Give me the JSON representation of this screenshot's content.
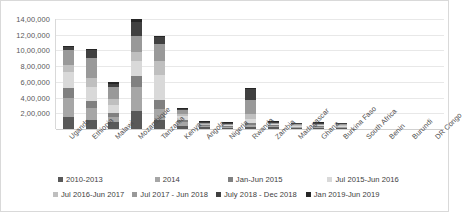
{
  "chart_data": {
    "type": "bar",
    "subtype": "stacked-bar",
    "title": "",
    "xlabel": "",
    "ylabel": "",
    "ylim": [
      0,
      1400000
    ],
    "grid": true,
    "legend_position": "bottom",
    "y_ticks": [
      {
        "value": 1400000,
        "label": "14,00,000"
      },
      {
        "value": 1200000,
        "label": "12,00,000"
      },
      {
        "value": 1000000,
        "label": "10,00,000"
      },
      {
        "value": 800000,
        "label": "8,00,000"
      },
      {
        "value": 600000,
        "label": "6,00,000"
      },
      {
        "value": 400000,
        "label": "4,00,000"
      },
      {
        "value": 200000,
        "label": "2,00,000"
      }
    ],
    "categories": [
      "Uganda",
      "Ethiopia",
      "Malawi",
      "Mozambique",
      "Tanzania",
      "Kenya",
      "Angola",
      "Nigeria",
      "Rwanda",
      "Zambia",
      "Madagascar",
      "Ghana",
      "Burkina Faso",
      "South Africa",
      "Benin",
      "Burundi",
      "DR Congo"
    ],
    "series": [
      {
        "name": "2010-2013",
        "color": "#595959",
        "values": [
          150000,
          120000,
          95000,
          230000,
          110000,
          40000,
          20000,
          15000,
          30000,
          20000,
          10000,
          15000,
          10000,
          0,
          0,
          0,
          0
        ]
      },
      {
        "name": "2014",
        "color": "#a6a6a6",
        "values": [
          250000,
          150000,
          55000,
          300000,
          145000,
          45000,
          15000,
          10000,
          25000,
          15000,
          5000,
          10000,
          5000,
          0,
          0,
          0,
          0
        ]
      },
      {
        "name": "Jan-Jun 2015",
        "color": "#808080",
        "values": [
          120000,
          90000,
          50000,
          150000,
          120000,
          30000,
          8000,
          5000,
          20000,
          10000,
          3000,
          8000,
          3000,
          0,
          0,
          0,
          0
        ]
      },
      {
        "name": "Jul 2015-Jun 2016",
        "color": "#d9d9d9",
        "values": [
          200000,
          180000,
          110000,
          190000,
          310000,
          50000,
          10000,
          6000,
          55000,
          15000,
          4000,
          10000,
          4000,
          0,
          0,
          0,
          0
        ]
      },
      {
        "name": "Jul 2016-Jun 2017",
        "color": "#bfbfbf",
        "values": [
          90000,
          110000,
          70000,
          110000,
          180000,
          30000,
          4000,
          3000,
          60000,
          10000,
          2000,
          7000,
          2000,
          0,
          0,
          0,
          0
        ]
      },
      {
        "name": "Jul 2017 - Jun 2018",
        "color": "#999999",
        "values": [
          190000,
          250000,
          150000,
          200000,
          220000,
          45000,
          3000,
          2000,
          180000,
          8000,
          2000,
          6000,
          2000,
          0,
          0,
          0,
          0
        ]
      },
      {
        "name": "July 2018 - Dec 2018",
        "color": "#404040",
        "values": [
          45000,
          100000,
          45000,
          180000,
          90000,
          15000,
          2000,
          1000,
          140000,
          4000,
          1000,
          3000,
          1000,
          0,
          0,
          0,
          0
        ]
      },
      {
        "name": "Jan 2019-Jun 2019",
        "color": "#262626",
        "values": [
          5000,
          20000,
          25000,
          40000,
          5000,
          5000,
          1000,
          1000,
          10000,
          3000,
          500,
          1000,
          500,
          0,
          0,
          0,
          0
        ]
      }
    ],
    "totals": [
      1050000,
      1020000,
      600000,
      1400000,
      1180000,
      260000,
      63000,
      43000,
      520000,
      85000,
      27500,
      60000,
      27500,
      0,
      0,
      0,
      0
    ]
  }
}
